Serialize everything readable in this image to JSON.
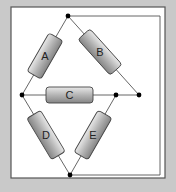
{
  "diagram": {
    "type": "circuit",
    "colors": {
      "background": "#c9c9c9",
      "panel": "#ffffff",
      "panel_border": "#555555",
      "wire": "#444444",
      "node": "#000000",
      "resistor_fill_light": "#e6e6e6",
      "resistor_fill_dark": "#8c8c8c",
      "resistor_stroke": "#444444"
    },
    "resistors": [
      {
        "id": "A",
        "label": "A"
      },
      {
        "id": "B",
        "label": "B"
      },
      {
        "id": "C",
        "label": "C"
      },
      {
        "id": "D",
        "label": "D"
      },
      {
        "id": "E",
        "label": "E"
      }
    ],
    "nodes": [
      {
        "id": "top"
      },
      {
        "id": "left"
      },
      {
        "id": "center-right"
      },
      {
        "id": "right"
      },
      {
        "id": "bottom"
      }
    ]
  }
}
